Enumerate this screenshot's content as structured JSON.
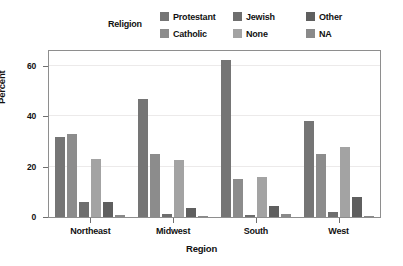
{
  "chart_data": {
    "type": "bar",
    "title": "",
    "xlabel": "Region",
    "ylabel": "Percent",
    "categories": [
      "Northeast",
      "Midwest",
      "South",
      "West"
    ],
    "ylim": [
      0,
      66
    ],
    "yticks": [
      0,
      20,
      40,
      60
    ],
    "ytick_labels": [
      "0",
      "20",
      "40",
      "60"
    ],
    "grid": true,
    "legend_title": "Religion",
    "legend_position": "top",
    "series": [
      {
        "name": "Protestant",
        "color": "#757575",
        "values": [
          32.0,
          46.8,
          62.4,
          38.0
        ]
      },
      {
        "name": "Catholic",
        "color": "#8c8c8c",
        "values": [
          33.0,
          25.2,
          15.0,
          25.0
        ]
      },
      {
        "name": "Jewish",
        "color": "#6e6e6e",
        "values": [
          6.0,
          1.2,
          1.0,
          1.8
        ]
      },
      {
        "name": "None",
        "color": "#a3a3a3",
        "values": [
          23.0,
          22.8,
          16.0,
          27.8
        ]
      },
      {
        "name": "Other",
        "color": "#5f5f5f",
        "values": [
          6.0,
          3.4,
          4.4,
          8.0
        ]
      },
      {
        "name": "NA",
        "color": "#8a8a8a",
        "values": [
          0.8,
          0.6,
          1.2,
          0.6
        ]
      }
    ]
  },
  "legend": {
    "title": "Religion",
    "rows": [
      [
        {
          "label": "Protestant",
          "color": "#757575"
        },
        {
          "label": "Jewish",
          "color": "#6e6e6e"
        },
        {
          "label": "Other",
          "color": "#5f5f5f"
        }
      ],
      [
        {
          "label": "Catholic",
          "color": "#8c8c8c"
        },
        {
          "label": "None",
          "color": "#a3a3a3"
        },
        {
          "label": "NA",
          "color": "#8a8a8a"
        }
      ]
    ]
  },
  "axes": {
    "y_label": "Percent",
    "x_label": "Region",
    "y_tick_labels": [
      "0",
      "20",
      "40",
      "60"
    ],
    "x_tick_labels": [
      "Northeast",
      "Midwest",
      "South",
      "West"
    ]
  },
  "colors": {
    "panel_border": "#8e8e8e",
    "gridline": "#eceaea",
    "axis": "#6f6f6f",
    "background": "#ffffff",
    "text": "#111111"
  }
}
